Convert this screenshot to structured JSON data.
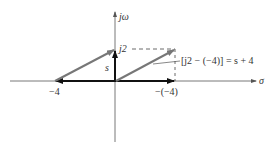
{
  "diagram": {
    "type": "s-plane vector diagram",
    "axes": {
      "horizontal_label": "σ",
      "vertical_label": "jω"
    },
    "labels": {
      "j2": "j2",
      "s": "s",
      "neg4": "−4",
      "neg_neg4": "−(−4)",
      "equation": "[j2 − (−4)] = s + 4"
    },
    "vectors": [
      {
        "name": "s",
        "from": [
          0,
          0
        ],
        "to": [
          0,
          2
        ]
      },
      {
        "name": "s-plus-4-at-pole",
        "from": [
          -4,
          0
        ],
        "to": [
          0,
          2
        ]
      },
      {
        "name": "s-plus-4-at-origin",
        "from": [
          0,
          0
        ],
        "to": [
          4,
          2
        ]
      },
      {
        "name": "neg4-vector",
        "from": [
          0,
          0
        ],
        "to": [
          -4,
          0
        ]
      },
      {
        "name": "neg-neg4-vector",
        "from": [
          0,
          0
        ],
        "to": [
          4,
          0
        ]
      }
    ],
    "colors": {
      "axis": "#555555",
      "vector_dark": "#111111",
      "vector_gray": "#777777",
      "dashed": "#444444"
    }
  }
}
